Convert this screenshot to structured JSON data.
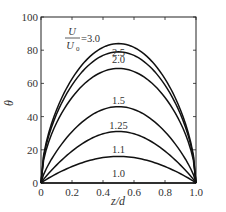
{
  "chart_data": {
    "type": "line",
    "title": "",
    "xlabel": "z/d",
    "ylabel": "θ",
    "xlim": [
      0,
      1.0
    ],
    "ylim": [
      0,
      100
    ],
    "xticks": [
      "0",
      "0.2",
      "0.4",
      "0.6",
      "0.8",
      "1.0"
    ],
    "yticks": [
      "0",
      "20",
      "40",
      "60",
      "80",
      "100"
    ],
    "grid": false,
    "legend": "inline labels",
    "parameter_label": "U/U0",
    "series": [
      {
        "name": "U/U0=3.0",
        "label": "3.0",
        "peak": 84,
        "x": [
          0,
          0.1,
          0.2,
          0.3,
          0.4,
          0.5,
          0.6,
          0.7,
          0.8,
          0.9,
          1.0
        ],
        "values": [
          0,
          53,
          70,
          79,
          83,
          84,
          83,
          79,
          70,
          53,
          0
        ]
      },
      {
        "name": "U/U0=2.5",
        "label": "2.5",
        "peak": 79,
        "x": [
          0,
          0.1,
          0.2,
          0.3,
          0.4,
          0.5,
          0.6,
          0.7,
          0.8,
          0.9,
          1.0
        ],
        "values": [
          0,
          47,
          64,
          74,
          78,
          79,
          78,
          74,
          64,
          47,
          0
        ]
      },
      {
        "name": "U/U0=2.0",
        "label": "2.0",
        "peak": 69,
        "x": [
          0,
          0.1,
          0.2,
          0.3,
          0.4,
          0.5,
          0.6,
          0.7,
          0.8,
          0.9,
          1.0
        ],
        "values": [
          0,
          37,
          53,
          63,
          68,
          69,
          68,
          63,
          53,
          37,
          0
        ]
      },
      {
        "name": "U/U0=1.5",
        "label": "1.5",
        "peak": 46,
        "x": [
          0,
          0.1,
          0.2,
          0.3,
          0.4,
          0.5,
          0.6,
          0.7,
          0.8,
          0.9,
          1.0
        ],
        "values": [
          0,
          17,
          31,
          40,
          45,
          46,
          45,
          40,
          31,
          17,
          0
        ]
      },
      {
        "name": "U/U0=1.25",
        "label": "1.25",
        "peak": 31,
        "x": [
          0,
          0.1,
          0.2,
          0.3,
          0.4,
          0.5,
          0.6,
          0.7,
          0.8,
          0.9,
          1.0
        ],
        "values": [
          0,
          10,
          18,
          25,
          29,
          31,
          29,
          25,
          18,
          10,
          0
        ]
      },
      {
        "name": "U/U0=1.1",
        "label": "1.1",
        "peak": 16,
        "x": [
          0,
          0.1,
          0.2,
          0.3,
          0.4,
          0.5,
          0.6,
          0.7,
          0.8,
          0.9,
          1.0
        ],
        "values": [
          0,
          5,
          9,
          13,
          15,
          16,
          15,
          13,
          9,
          5,
          0
        ]
      },
      {
        "name": "U/U0=1.0",
        "label": "1.0",
        "peak": 0,
        "x": [
          0,
          0.1,
          0.2,
          0.3,
          0.4,
          0.5,
          0.6,
          0.7,
          0.8,
          0.9,
          1.0
        ],
        "values": [
          0,
          0,
          0,
          0,
          0,
          0,
          0,
          0,
          0,
          0,
          0
        ]
      }
    ]
  },
  "annotation": {
    "numerator": "U",
    "denominator": "U",
    "subscript": "0",
    "value": "=3.0"
  }
}
